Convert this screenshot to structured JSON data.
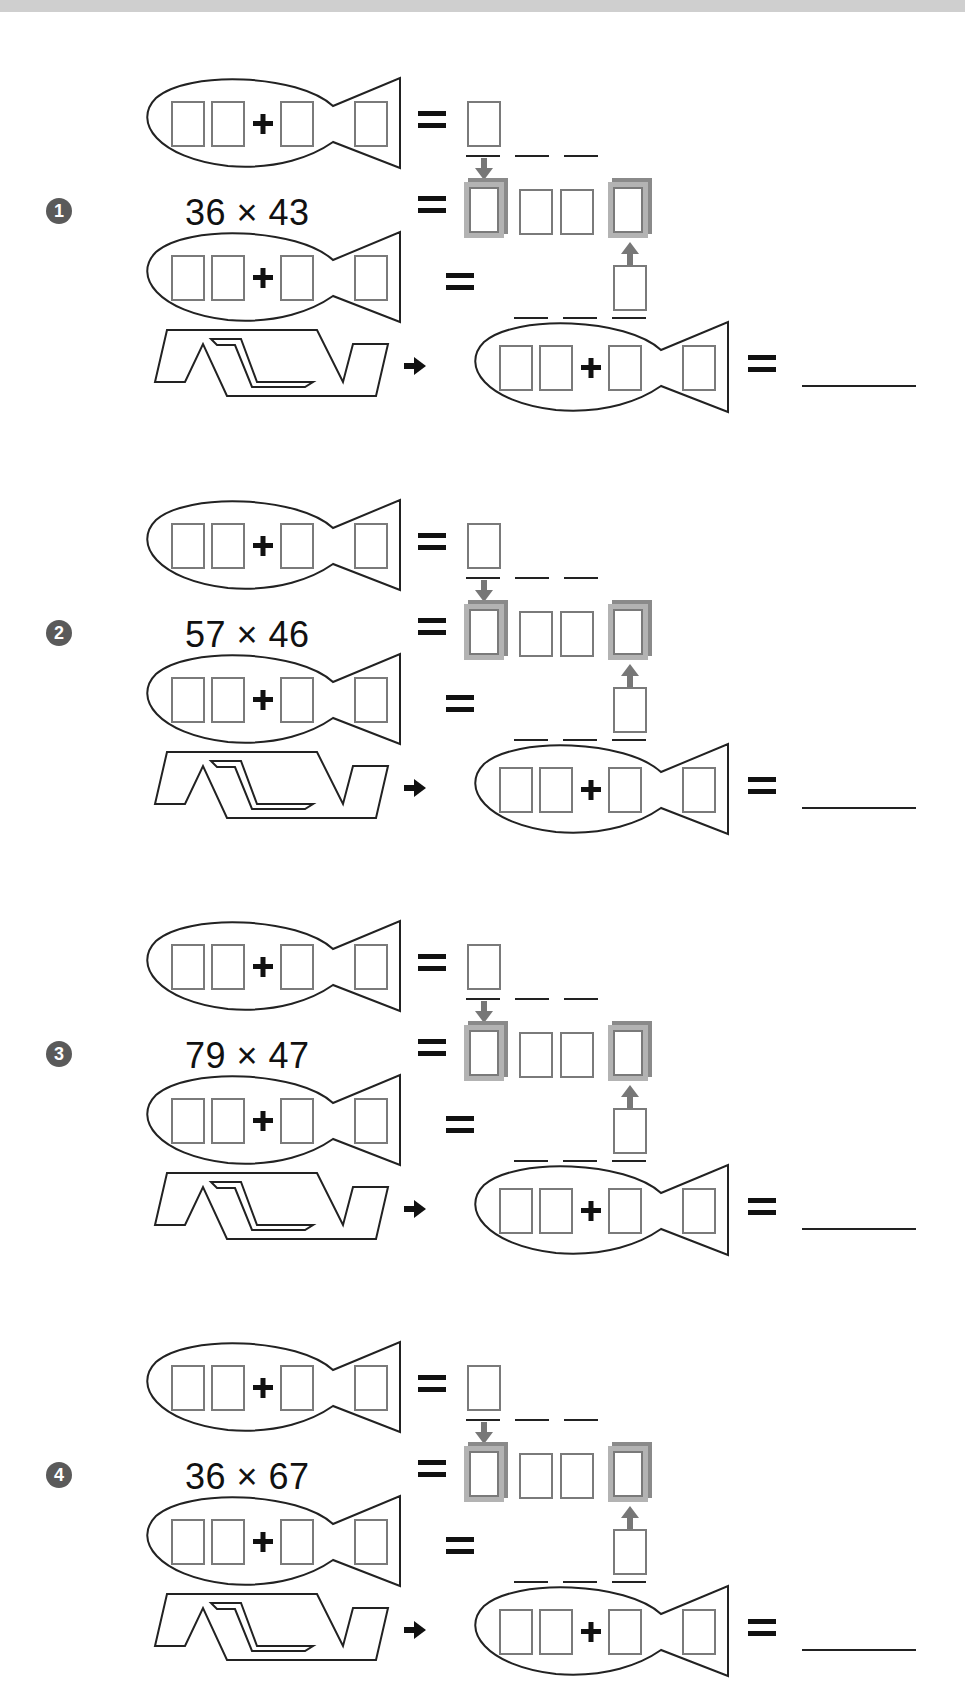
{
  "worksheet": {
    "problems": [
      {
        "number": "1",
        "badge": "❶",
        "expression": "36 × 43",
        "multiplicand": 36,
        "multiplier": 43
      },
      {
        "number": "2",
        "badge": "❷",
        "expression": "57 × 46",
        "multiplicand": 57,
        "multiplier": 46
      },
      {
        "number": "3",
        "badge": "❸",
        "expression": "79 × 47",
        "multiplicand": 79,
        "multiplier": 47
      },
      {
        "number": "4",
        "badge": "❹",
        "expression": "36 × 67",
        "multiplicand": 36,
        "multiplier": 67
      }
    ],
    "symbols": {
      "plus": "+",
      "equals": "=",
      "arrow": "➡",
      "times": "×"
    },
    "colors": {
      "outline": "#222222",
      "box_border": "#7a7a7a",
      "highlight_box": "#a8a8a8",
      "arrow": "#777777",
      "badge_bg": "#5a5a5a",
      "topbar": "#cfcfcf"
    }
  }
}
